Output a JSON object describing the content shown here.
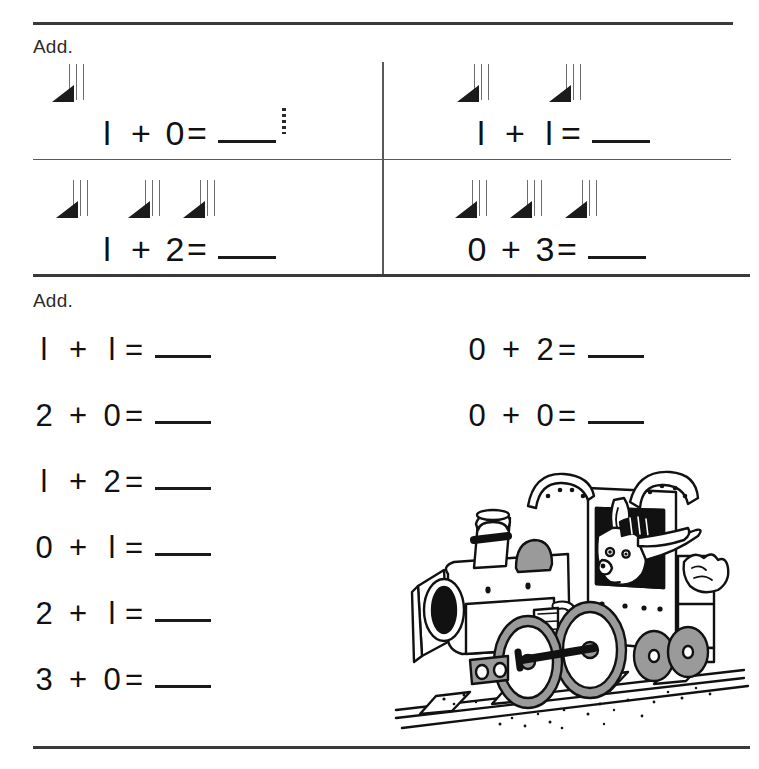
{
  "worksheet": {
    "sections": [
      {
        "instruction": "Add.",
        "type": "picture-grid",
        "problems": [
          {
            "addend1": "l",
            "operator": "+",
            "addend2": "0",
            "equals": "=",
            "answer": "",
            "counters": 1,
            "cell": "top-left"
          },
          {
            "addend1": "l",
            "operator": "+",
            "addend2": "l",
            "equals": "=",
            "answer": "",
            "counters": 2,
            "cell": "top-right"
          },
          {
            "addend1": "l",
            "operator": "+",
            "addend2": "2",
            "equals": "=",
            "answer": "",
            "counters": 3,
            "cell": "bottom-left"
          },
          {
            "addend1": "0",
            "operator": "+",
            "addend2": "3",
            "equals": "=",
            "answer": "",
            "counters": 3,
            "cell": "bottom-right"
          }
        ]
      },
      {
        "instruction": "Add.",
        "type": "equation-list",
        "left_column": [
          {
            "addend1": "l",
            "operator": "+",
            "addend2": "l",
            "equals": "=",
            "answer": ""
          },
          {
            "addend1": "2",
            "operator": "+",
            "addend2": "0",
            "equals": "=",
            "answer": ""
          },
          {
            "addend1": "l",
            "operator": "+",
            "addend2": "2",
            "equals": "=",
            "answer": ""
          },
          {
            "addend1": "0",
            "operator": "+",
            "addend2": "l",
            "equals": "=",
            "answer": ""
          },
          {
            "addend1": "2",
            "operator": "+",
            "addend2": "l",
            "equals": "=",
            "answer": ""
          },
          {
            "addend1": "3",
            "operator": "+",
            "addend2": "0",
            "equals": "=",
            "answer": ""
          }
        ],
        "right_column": [
          {
            "addend1": "0",
            "operator": "+",
            "addend2": "2",
            "equals": "=",
            "answer": ""
          },
          {
            "addend1": "0",
            "operator": "+",
            "addend2": "0",
            "equals": "=",
            "answer": ""
          }
        ]
      }
    ],
    "illustration": {
      "name": "steam-locomotive-with-rabbit-engineer",
      "description": "Black and white line drawing of a steam train engine on railroad tracks with a rabbit engineer in an engineer's cap waving from the cab window"
    },
    "colors": {
      "ink": "#111111",
      "rule": "#3a3a3a",
      "counter_fill": "#1b1b1b",
      "wheel_fill": "#9a9a9a"
    }
  }
}
